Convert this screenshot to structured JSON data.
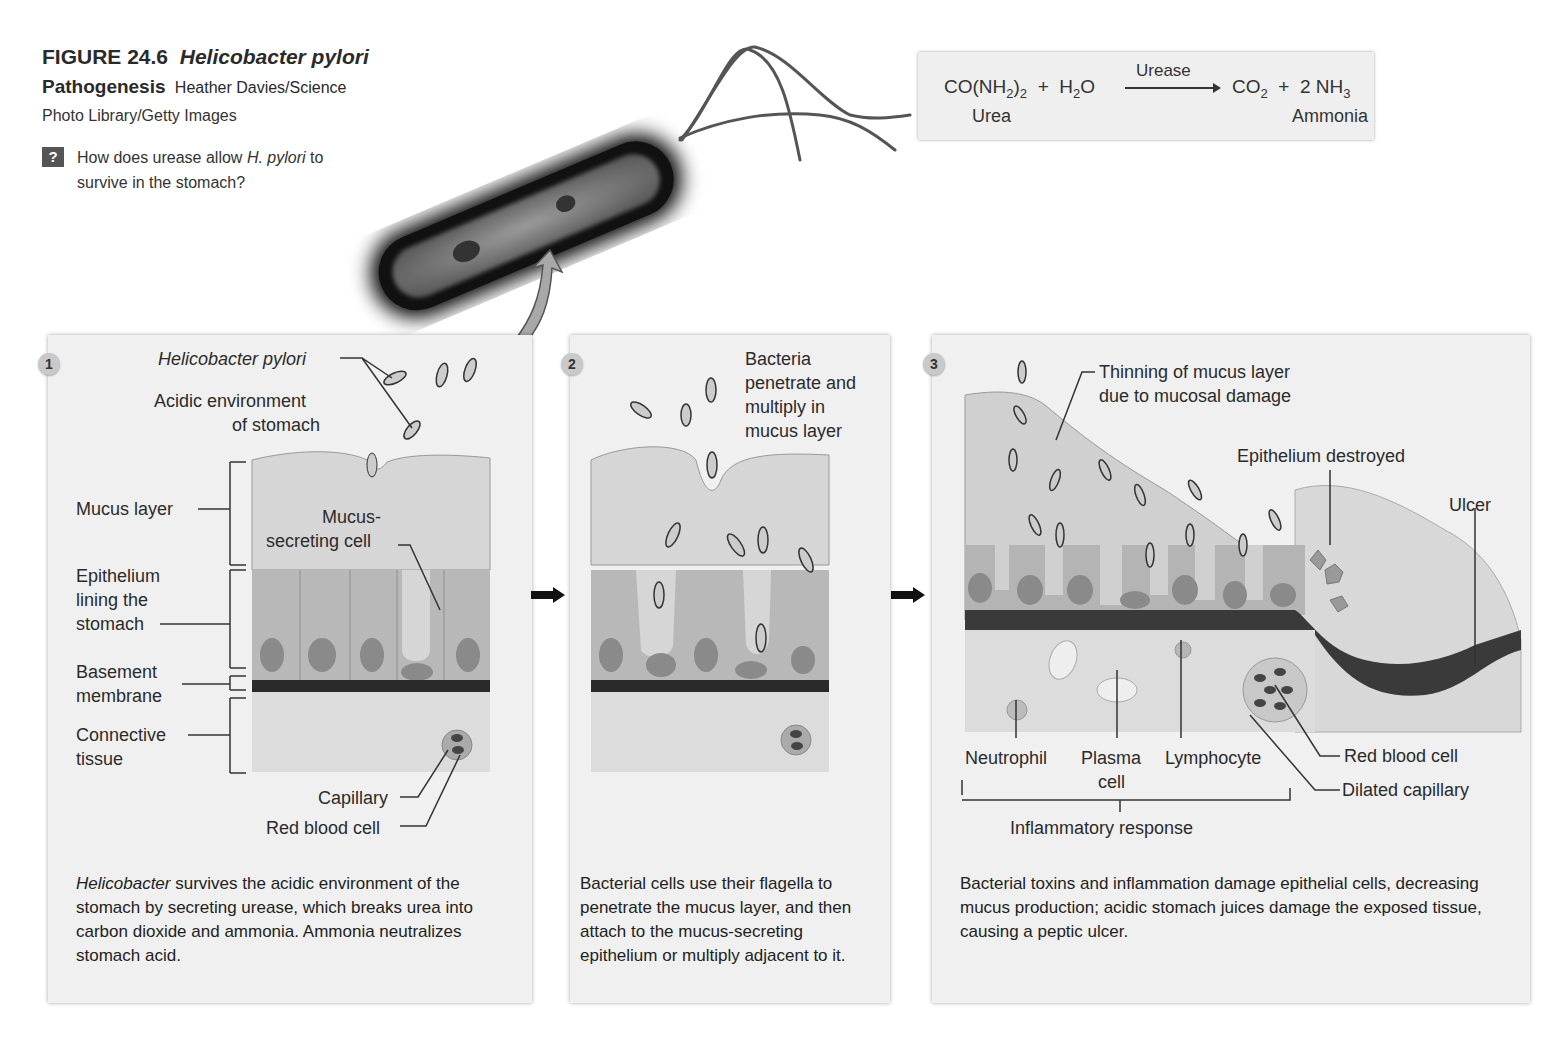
{
  "figure": {
    "number": "FIGURE 24.6",
    "title_italic": "Helicobacter pylori",
    "title_bold": "Pathogenesis",
    "credit_line1": "Heather Davies/Science",
    "credit_line2": "Photo Library/Getty Images",
    "question_icon": "?",
    "question_pre": "How does urease allow ",
    "question_italic": "H. pylori",
    "question_post1": " to",
    "question_line2": "survive in the stomach?"
  },
  "equation": {
    "reactant1": "CO(NH",
    "reactant1_sub1": "2",
    "reactant1_close": ")",
    "reactant1_sub2": "2",
    "plus1": "+",
    "reactant2": "H",
    "reactant2_sub": "2",
    "reactant2_tail": "O",
    "enzyme": "Urease",
    "product1": "CO",
    "product1_sub": "2",
    "plus2": "+",
    "product2": "2 NH",
    "product2_sub": "3",
    "label_urea": "Urea",
    "label_ammonia": "Ammonia"
  },
  "panels": [
    {
      "step": "1",
      "labels": {
        "h_pylori": "Helicobacter pylori",
        "acidic_1": "Acidic environment",
        "acidic_2": "of stomach",
        "mucus_layer": "Mucus layer",
        "mucus_cell_1": "Mucus-",
        "mucus_cell_2": "secreting cell",
        "epithelium_1": "Epithelium",
        "epithelium_2": "lining the",
        "epithelium_3": "stomach",
        "basement_1": "Basement",
        "basement_2": "membrane",
        "connective_1": "Connective",
        "connective_2": "tissue",
        "capillary": "Capillary",
        "rbc": "Red blood cell"
      },
      "caption_italic": "Helicobacter",
      "caption": " survives the acidic environment of the stomach by secreting urease, which breaks urea into carbon dioxide and ammonia. Ammonia neutralizes stomach acid."
    },
    {
      "step": "2",
      "labels": {
        "l1": "Bacteria",
        "l2": "penetrate and",
        "l3": "multiply in",
        "l4": "mucus layer"
      },
      "caption": "Bacterial cells use their flagella to penetrate the mucus layer, and then attach to the mucus-secreting epithelium or multiply adjacent to it."
    },
    {
      "step": "3",
      "labels": {
        "thinning_1": "Thinning of mucus layer",
        "thinning_2": "due to mucosal damage",
        "epi_destroyed": "Epithelium destroyed",
        "ulcer": "Ulcer",
        "neutrophil": "Neutrophil",
        "plasma_1": "Plasma",
        "plasma_2": "cell",
        "lymphocyte": "Lymphocyte",
        "rbc": "Red blood cell",
        "dilated": "Dilated capillary",
        "inflammatory": "Inflammatory response"
      },
      "caption": "Bacterial toxins and inflammation damage epithelial cells, decreasing mucus production; acidic stomach juices damage the exposed tissue, causing a peptic ulcer."
    }
  ],
  "colors": {
    "panel_bg": "#f0f0f0",
    "mucus": "#d6d6d6",
    "epithelium": "#b8b8b8",
    "nucleus": "#8a8a8a",
    "basement": "#2a2a2a",
    "connective": "#dcdcdc"
  }
}
